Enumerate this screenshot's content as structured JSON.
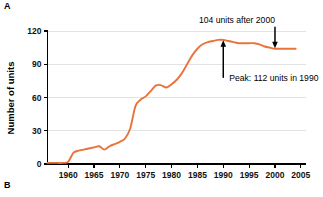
{
  "figure": {
    "panel_a_label": "A",
    "panel_b_label": "B"
  },
  "chart_data": {
    "type": "line",
    "title": "",
    "xlabel": "",
    "ylabel": "Number of units",
    "xlim": [
      1956,
      2006
    ],
    "ylim": [
      0,
      120
    ],
    "grid": true,
    "legend": "none",
    "line_color": "#E8743B",
    "x_ticks": [
      1960,
      1965,
      1970,
      1975,
      1980,
      1985,
      1990,
      1995,
      2000,
      2005
    ],
    "y_ticks": [
      0,
      30,
      60,
      90,
      120
    ],
    "annotations": [
      {
        "id": "peak",
        "text": "Peak: 112 units in 1990",
        "x": 1990,
        "y": 112,
        "arrow": "up"
      },
      {
        "id": "after-2000",
        "text": "104 units after 2000",
        "x": 2000,
        "y": 104,
        "arrow": "down"
      }
    ],
    "x": [
      1956,
      1957,
      1958,
      1959,
      1960,
      1961,
      1962,
      1963,
      1964,
      1965,
      1966,
      1967,
      1968,
      1969,
      1970,
      1971,
      1972,
      1973,
      1974,
      1975,
      1976,
      1977,
      1978,
      1979,
      1980,
      1981,
      1982,
      1983,
      1984,
      1985,
      1986,
      1987,
      1988,
      1989,
      1990,
      1991,
      1992,
      1993,
      1994,
      1995,
      1996,
      1997,
      1998,
      1999,
      2000,
      2001,
      2002,
      2003,
      2004
    ],
    "values": [
      1,
      1,
      1,
      1,
      2,
      10,
      12,
      13,
      14,
      15,
      16,
      13,
      16,
      18,
      20,
      23,
      32,
      52,
      58,
      61,
      66,
      71,
      71,
      69,
      72,
      76,
      82,
      90,
      98,
      104,
      108,
      110,
      111,
      112,
      112,
      111,
      110,
      109,
      109,
      109,
      109,
      108,
      106,
      105,
      104,
      104,
      104,
      104,
      104
    ]
  }
}
